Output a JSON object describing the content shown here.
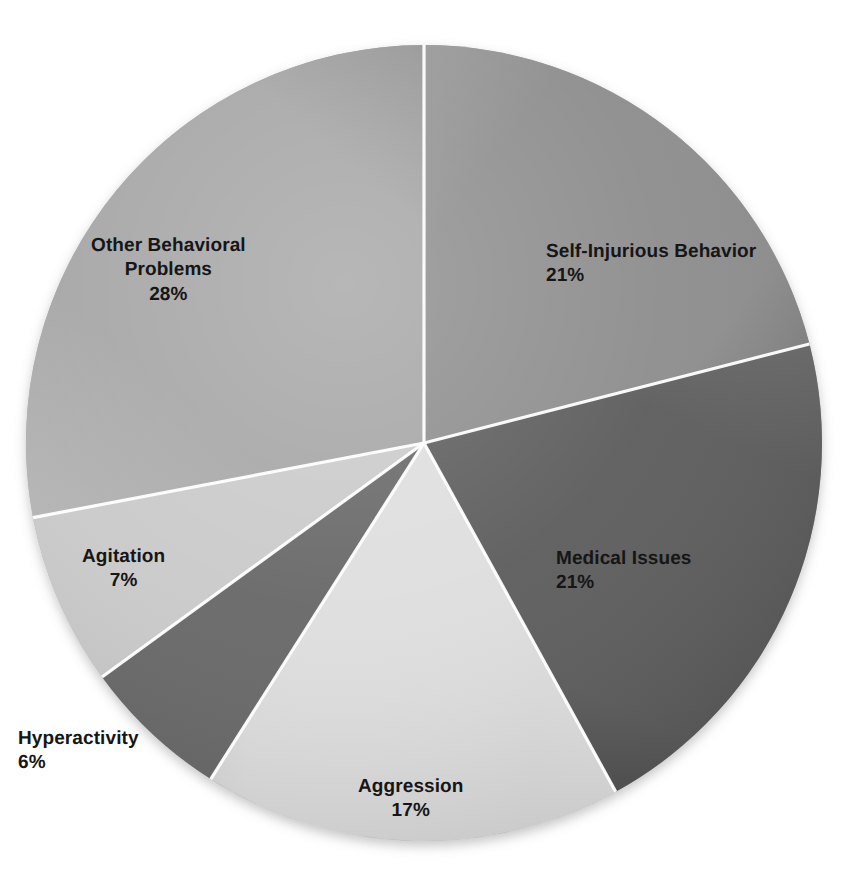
{
  "chart_data": {
    "type": "pie",
    "title": "",
    "subtitle": "",
    "xlabel": "",
    "ylabel": "",
    "legend_position": "none",
    "grid": false,
    "labels_show_percent": true,
    "start_angle_deg": 0,
    "direction": "clockwise",
    "center_px": [
      424,
      443
    ],
    "radius_px": 398,
    "categories": [
      "Self-Injurious Behavior",
      "Medical Issues",
      "Aggression",
      "Hyperactivity",
      "Agitation",
      "Other Behavioral Problems"
    ],
    "values": [
      21,
      21,
      17,
      6,
      7,
      28
    ],
    "slices": [
      {
        "label": "Self-Injurious Behavior",
        "percent": 21,
        "percent_text": "21%",
        "color": "#8d8d8d",
        "color_light": "#a4a4a4",
        "color_dark": "#6f6f6f"
      },
      {
        "label": "Medical Issues",
        "percent": 21,
        "percent_text": "21%",
        "color": "#5d5d5d",
        "color_light": "#767676",
        "color_dark": "#454545"
      },
      {
        "label": "Aggression",
        "percent": 17,
        "percent_text": "17%",
        "color": "#dedede",
        "color_light": "#efefef",
        "color_dark": "#c6c6c6"
      },
      {
        "label": "Hyperactivity",
        "percent": 6,
        "percent_text": "6%",
        "color": "#686868",
        "color_light": "#7e7e7e",
        "color_dark": "#525252"
      },
      {
        "label": "Agitation",
        "percent": 7,
        "percent_text": "7%",
        "color": "#cacaca",
        "color_light": "#dcdcdc",
        "color_dark": "#b2b2b2"
      },
      {
        "label": "Other Behavioral Problems",
        "percent": 28,
        "percent_text": "28%",
        "color": "#a5a5a5",
        "color_light": "#bcbcbc",
        "color_dark": "#8d8d8d"
      }
    ]
  },
  "labels": {
    "self_injurious": {
      "name": "Self-Injurious Behavior",
      "pct": "21%"
    },
    "medical": {
      "name": "Medical Issues",
      "pct": "21%"
    },
    "aggression": {
      "name": "Aggression",
      "pct": "17%"
    },
    "hyperactivity": {
      "name": "Hyperactivity",
      "pct": "6%"
    },
    "agitation": {
      "name": "Agitation",
      "pct": "7%"
    },
    "other_line1": "Other Behavioral",
    "other_line2": "Problems",
    "other_pct": "28%"
  },
  "colors": {
    "background": "#ffffff",
    "label_text": "#161616",
    "separator": "#ffffff"
  }
}
